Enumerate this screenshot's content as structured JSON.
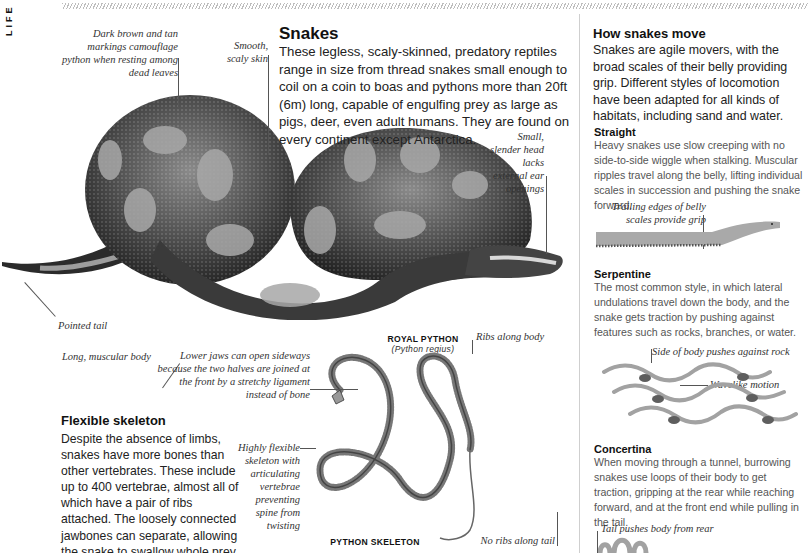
{
  "page": {
    "section_label": "LIFE",
    "colors": {
      "hatch": "#bdbdbd",
      "divider": "#cfcfcf",
      "snake_body": "#9a9a9a",
      "snake_rock": "#5e5e5e"
    }
  },
  "snakes": {
    "title": "Snakes",
    "body": "These legless, scaly-skinned, predatory reptiles range in size from thread snakes small enough to coil on a coin to boas and pythons more than 20ft (6m) long, capable of engulfing prey as large as pigs, deer, even adult humans. They are found on every continent except Antarctica."
  },
  "python_figure": {
    "label": "ROYAL PYTHON",
    "sublabel": "(Python regius)",
    "callouts": {
      "markings": "Dark brown and tan markings camouflage python when resting among dead leaves",
      "skin": "Smooth, scaly skin",
      "head": "Small, slender head lacks external ear openings",
      "tail": "Pointed tail",
      "body": "Long, muscular body"
    }
  },
  "skeleton_section": {
    "title": "Flexible skeleton",
    "body": "Despite the absence of limbs, snakes have more bones than other vertebrates. These include up to 400 vertebrae, almost all of which have a pair of ribs attached. The loosely connected jawbones can separate, allowing the snake to swallow whole prey much larger than its own head."
  },
  "skeleton_figure": {
    "label": "PYTHON SKELETON",
    "callouts": {
      "jaws": "Lower jaws can open sideways because the two halves are joined at the front by a stretchy ligament instead of bone",
      "ribs": "Ribs along body",
      "flexible": "Highly flexible skeleton with articulating vertebrae preventing spine from twisting",
      "tail": "No ribs along tail"
    }
  },
  "movement": {
    "title": "How snakes move",
    "intro": "Snakes are agile movers, with the broad scales of their belly providing grip. Different styles of locomotion have been adapted for all kinds of habitats, including sand and water.",
    "styles": [
      {
        "name": "Straight",
        "text": "Heavy snakes use slow creeping with no side-to-side wiggle when stalking. Muscular ripples travel along the belly, lifting individual scales in succession and pushing the snake forward.",
        "callouts": [
          "Trailing edges of belly scales provide grip"
        ]
      },
      {
        "name": "Serpentine",
        "text": "The most common style, in which lateral undulations travel down the body, and the snake gets traction by pushing against features such as rocks, branches, or water.",
        "callouts": [
          "Side of body pushes against rock",
          "Wavelike motion"
        ]
      },
      {
        "name": "Concertina",
        "text": "When moving through a tunnel, burrowing snakes use loops of their body to get traction, gripping at the rear while reaching forward, and at the front end while pulling in the tail.",
        "callouts": [
          "Tail pushes body from rear"
        ]
      }
    ]
  }
}
